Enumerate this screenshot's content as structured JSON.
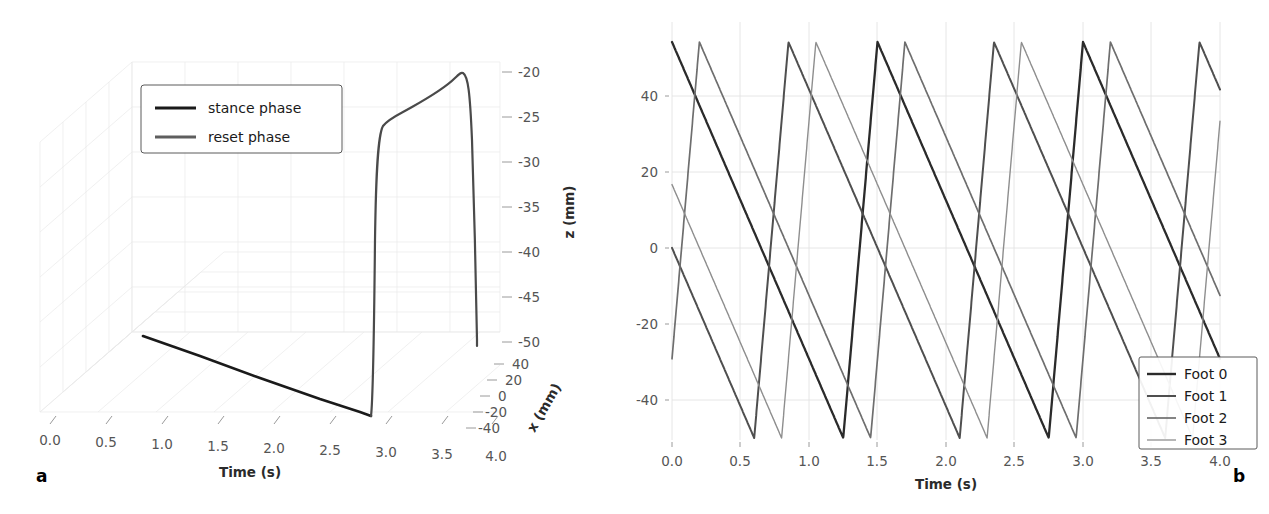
{
  "figure": {
    "panels": [
      {
        "label": "a",
        "type": "3d-line",
        "legend": [
          {
            "name": "stance phase",
            "color": "#1a1a1a",
            "width": 2.6
          },
          {
            "name": "reset phase",
            "color": "#5e5e5e",
            "width": 2.6
          }
        ],
        "axes": {
          "x_title": "Time (s)",
          "x_ticks": [
            "0.0",
            "0.5",
            "1.0",
            "1.5",
            "2.0",
            "2.5",
            "3.0",
            "3.5",
            "4.0"
          ],
          "depth_title": "x (mm)",
          "depth_ticks": [
            "40",
            "20",
            "0",
            "-20",
            "-40"
          ],
          "z_title": "z (mm)",
          "z_ticks": [
            "-20",
            "-25",
            "-30",
            "-35",
            "-40",
            "-45",
            "-50"
          ]
        }
      },
      {
        "label": "b",
        "type": "line",
        "axes": {
          "x_title": "Time (s)",
          "x_ticks": [
            "0.0",
            "0.5",
            "1.0",
            "1.5",
            "2.0",
            "2.5",
            "3.0",
            "3.5",
            "4.0"
          ],
          "y_title": "Foot x-coordinate (mm)",
          "y_ticks": [
            "40",
            "20",
            "0",
            "-20",
            "-40"
          ]
        },
        "legend": [
          {
            "name": "Foot 0",
            "color": "#2b2b2b",
            "width": 2.4
          },
          {
            "name": "Foot 1",
            "color": "#4f4f4f",
            "width": 2.0
          },
          {
            "name": "Foot 2",
            "color": "#6e6e6e",
            "width": 1.6
          },
          {
            "name": "Foot 3",
            "color": "#8e8e8e",
            "width": 1.2
          }
        ]
      }
    ]
  },
  "chart_data": [
    {
      "type": "line",
      "panel": "a",
      "title": "",
      "xlabel": "Time (s)",
      "ylabel": "x (mm)",
      "zlabel": "z (mm)",
      "projection": "3d",
      "xlim": [
        0.0,
        4.3
      ],
      "zlim": [
        -52,
        -19
      ],
      "ylim": [
        -50,
        50
      ],
      "grid": true,
      "legend_position": "upper-left",
      "series": [
        {
          "name": "stance phase",
          "color": "#1a1a1a",
          "t": [
            0.85,
            1.4,
            1.9,
            2.4,
            2.9,
            3.08
          ],
          "x_mm": [
            50,
            32,
            16,
            -1,
            -18,
            -24
          ],
          "z_mm": [
            -50,
            -50,
            -50,
            -50,
            -50,
            -50
          ]
        },
        {
          "name": "reset phase",
          "color": "#5e5e5e",
          "t": [
            3.08,
            3.12,
            3.2,
            3.3,
            3.42,
            3.8,
            4.1,
            4.18,
            4.22,
            4.3,
            4.33
          ],
          "x_mm": [
            -24,
            -26,
            -30,
            -36,
            -42,
            -30,
            -10,
            10,
            30,
            45,
            50
          ],
          "z_mm": [
            -50,
            -46,
            -38,
            -30,
            -25,
            -23.5,
            -21.5,
            -20.3,
            -22,
            -38,
            -51
          ]
        }
      ]
    },
    {
      "type": "line",
      "panel": "b",
      "title": "",
      "xlabel": "Time (s)",
      "ylabel": "Foot x-coordinate (mm)",
      "xlim": [
        -0.05,
        4.05
      ],
      "ylim": [
        -56,
        56
      ],
      "grid": true,
      "legend_position": "lower-right",
      "period_s": 1.5,
      "stance_duration_s": 1.25,
      "reset_duration_s": 0.25,
      "amplitude_mm": 50,
      "x": [
        0.0,
        0.5,
        1.0,
        1.5,
        2.0,
        2.5,
        3.0,
        3.5,
        4.0
      ],
      "series": [
        {
          "name": "Foot 0",
          "color": "#2b2b2b",
          "phase_offset_s": 0.0,
          "values": [
            50,
            30,
            10,
            -10,
            -30,
            -50,
            -50,
            10,
            50
          ]
        },
        {
          "name": "Foot 1",
          "color": "#4f4f4f",
          "phase_offset_s": 0.85,
          "values": [
            17,
            -3,
            -23,
            -43,
            -50,
            30,
            10,
            -10,
            -30
          ]
        },
        {
          "name": "Foot 2",
          "color": "#6e6e6e",
          "phase_offset_s": 1.7,
          "values": [
            -17,
            -37,
            -50,
            30,
            10,
            -10,
            -30,
            -50,
            17
          ]
        },
        {
          "name": "Foot 3",
          "color": "#8e8e8e",
          "phase_offset_s": 2.55,
          "values": [
            -50,
            -50,
            30,
            10,
            -10,
            -30,
            -50,
            20,
            -30
          ]
        }
      ]
    }
  ]
}
